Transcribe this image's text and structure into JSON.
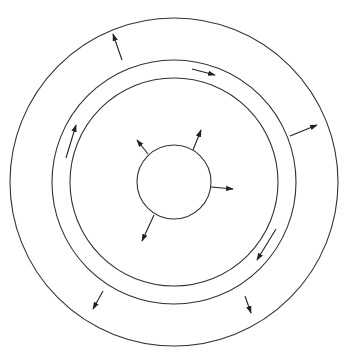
{
  "diagram": {
    "stroke_color": "#333333",
    "background": "#ffffff",
    "center": [
      174,
      182
    ],
    "circles": [
      {
        "name": "outer-circle",
        "r": 164
      },
      {
        "name": "middle-circle",
        "r": 122
      },
      {
        "name": "inner-circle",
        "r": 104
      },
      {
        "name": "core-circle",
        "r": 37
      }
    ],
    "arrows": [
      {
        "name": "outer-band-arrow-top",
        "from": [
          122,
          60
        ],
        "to": [
          113,
          34
        ],
        "type": "radial"
      },
      {
        "name": "outer-band-arrow-right",
        "from": [
          290,
          136
        ],
        "to": [
          317,
          125
        ],
        "type": "radial"
      },
      {
        "name": "outer-band-arrow-bottom-right",
        "from": [
          245,
          296
        ],
        "to": [
          251,
          313
        ],
        "type": "radial"
      },
      {
        "name": "outer-band-arrow-bottom-left",
        "from": [
          103,
          291
        ],
        "to": [
          93,
          309
        ],
        "type": "radial"
      },
      {
        "name": "gap-arrow-top",
        "from": [
          192,
          69
        ],
        "to": [
          215,
          75
        ],
        "type": "tangential"
      },
      {
        "name": "gap-arrow-left",
        "from": [
          66,
          158
        ],
        "to": [
          76,
          125
        ],
        "type": "tangential"
      },
      {
        "name": "gap-arrow-bottom-right",
        "from": [
          276,
          229
        ],
        "to": [
          257,
          260
        ],
        "type": "tangential"
      },
      {
        "name": "core-arrow-upper-left",
        "from": [
          148,
          154
        ],
        "to": [
          137,
          140
        ],
        "type": "radial"
      },
      {
        "name": "core-arrow-upper-right",
        "from": [
          193,
          150
        ],
        "to": [
          201,
          130
        ],
        "type": "radial"
      },
      {
        "name": "core-arrow-right",
        "from": [
          211,
          187
        ],
        "to": [
          233,
          189
        ],
        "type": "radial"
      },
      {
        "name": "core-arrow-lower-left",
        "from": [
          154,
          215
        ],
        "to": [
          142,
          241
        ],
        "type": "radial"
      }
    ]
  }
}
